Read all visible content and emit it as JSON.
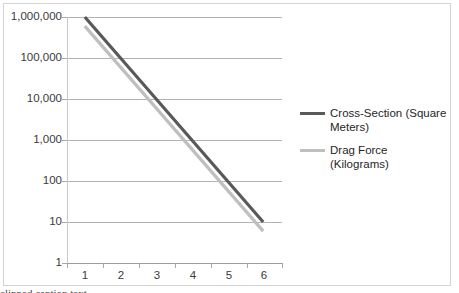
{
  "chart_data": {
    "type": "line",
    "title": "",
    "subtitle": "",
    "xlabel": "",
    "ylabel": "",
    "x": [
      1,
      2,
      3,
      4,
      5,
      6
    ],
    "x_tick_labels": [
      "1",
      "2",
      "3",
      "4",
      "5",
      "6"
    ],
    "y_scale": "log",
    "ylim": [
      1,
      1000000
    ],
    "y_tick_labels": [
      "1,000,000",
      "100,000",
      "10,000",
      "1,000",
      "100",
      "10",
      "1"
    ],
    "y_tick_values": [
      1000000,
      100000,
      10000,
      1000,
      100,
      10,
      1
    ],
    "grid": "horizontal",
    "legend_position": "right",
    "series": [
      {
        "name": "Cross-Section (Square Meters)",
        "color": "#595959",
        "values": [
          1000000,
          100000,
          10000,
          1000,
          100,
          10
        ]
      },
      {
        "name": "Drag Force (Kilograms)",
        "color": "#bfbfbf",
        "values": [
          600000,
          60000,
          6000,
          600,
          60,
          6
        ]
      }
    ]
  },
  "y_axis": {
    "labels": [
      {
        "text": "1,000,000",
        "value": 1000000
      },
      {
        "text": "100,000",
        "value": 100000
      },
      {
        "text": "10,000",
        "value": 10000
      },
      {
        "text": "1,000",
        "value": 1000
      },
      {
        "text": "100",
        "value": 100
      },
      {
        "text": "10",
        "value": 10
      },
      {
        "text": "1",
        "value": 1
      }
    ]
  },
  "x_axis": {
    "labels": [
      {
        "text": "1"
      },
      {
        "text": "2"
      },
      {
        "text": "3"
      },
      {
        "text": "4"
      },
      {
        "text": "5"
      },
      {
        "text": "6"
      }
    ]
  },
  "legend": {
    "entries": [
      {
        "label": "Cross-Section (Square Meters)",
        "color": "#595959"
      },
      {
        "label": "Drag Force (Kilograms)",
        "color": "#bfbfbf"
      }
    ]
  },
  "caption": {
    "line": "clipped caption text"
  },
  "colors": {
    "series_dark": "#595959",
    "series_light": "#bfbfbf",
    "gridline": "#b3b3b3",
    "frame_border": "#d4d4d4",
    "text": "#3a3a3a"
  }
}
